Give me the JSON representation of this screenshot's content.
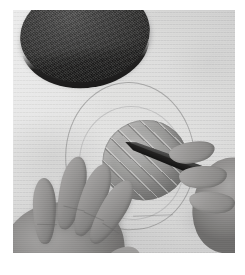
{
  "image": {
    "domain": "Natural-Image",
    "title": "Hands scoring a clay mound with a modelling tool",
    "description": "Close-up overhead photograph of two hands working on a light grey paper work surface. The left hand rests flat with fingers spread; the right hand holds a dark pointed modelling knife and draws diagonal score lines across a rounded grey clay mound. A faint pencil oval is drawn on the paper around the clay. A dark, coarsely textured round slab sits at the top-left corner.",
    "orientation": "portrait",
    "color_mode": "near-greyscale / desaturated colour",
    "print_border": "white paper margin on all four sides"
  },
  "palette": {
    "paper_white": "#ffffff",
    "surface_light": "#e9e9e7",
    "surface_mid": "#d5d5d3",
    "surface_shade": "#c9c9c7",
    "clay_highlight": "#b8b5ae",
    "clay_mid": "#96938c",
    "clay_shadow": "#83807a",
    "skin_highlight": "#ada79f",
    "skin_mid": "#968f88",
    "skin_shadow": "#746e68",
    "dark_disc_highlight": "#565452",
    "dark_disc_mid": "#43413f",
    "dark_disc_shadow": "#2b2926",
    "tool_metal": "#4a4845",
    "tool_dark": "#121110",
    "pencil_line": "rgba(118,118,116,.52)"
  },
  "objects": [
    {
      "id": "dark-disc",
      "label": "Dark textured disc",
      "detail": "Coarse-grained near-black round slab with a visible side thickness, partly cropped by the top edge of the frame; casts a soft shadow onto the paper.",
      "position": "top-left",
      "tone": "darkest element in the frame"
    },
    {
      "id": "clay-mound",
      "label": "Clay mound",
      "detail": "Rounded oval dome of grey clay, roughly 86 x 80 px, tilted about 12 degrees; its upper surface carries evenly spaced diagonal score lines running from upper-right to lower-left.",
      "position": "centre",
      "score_line_count": 9,
      "score_line_direction": "upper-right to lower-left"
    },
    {
      "id": "modelling-tool",
      "label": "Modelling knife",
      "detail": "Dark tapered blade with its point resting on the clay; the blade widens toward a dark handle gripped by the right hand at the right edge of the frame.",
      "position": "centre-right",
      "angle_degrees": 21
    },
    {
      "id": "left-hand",
      "label": "Left hand",
      "detail": "Palm down, four fingers spread and thumb tucked toward the clay, resting flat on the paper at the lower-left; soft contact shadow beneath.",
      "position": "lower-left",
      "visible_fingers": 4
    },
    {
      "id": "right-hand",
      "label": "Right hand",
      "detail": "Only the gripping fingers are visible, curled over the dark handle of the modelling tool at the right edge of the frame.",
      "position": "right edge",
      "visible_fingers": 3
    },
    {
      "id": "pencil-guide",
      "label": "Pencil guide oval",
      "detail": "Faint hand-drawn oval outline on the paper enclosing the clay mound, with a second fainter inner arc and a short scuff mark below.",
      "position": "centre, around the clay"
    },
    {
      "id": "work-surface",
      "label": "Work surface",
      "detail": "Light grey textured paper or board filling the frame, with subtle vertical grain and soft tonal blotches.",
      "position": "full frame background"
    }
  ],
  "composition": {
    "frame_inset_px": {
      "left": 13,
      "top": 10,
      "right": 10,
      "bottom": 22
    },
    "photo_size_px": {
      "width": 222,
      "height": 243
    },
    "canvas_size_px": {
      "width": 245,
      "height": 275
    },
    "light_direction": "upper-left, soft diffuse",
    "focal_point": "clay mound and the tool tip"
  }
}
